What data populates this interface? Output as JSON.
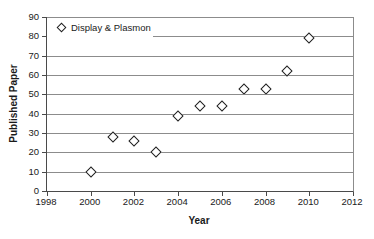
{
  "chart_data": {
    "type": "scatter",
    "title": "",
    "xlabel": "Year",
    "ylabel": "Published Paper",
    "legend": {
      "label": "Display & Plasmon",
      "marker": "open-diamond",
      "position": "top-left-inside"
    },
    "series": [
      {
        "name": "Display & Plasmon",
        "x": [
          2000,
          2001,
          2002,
          2003,
          2004,
          2005,
          2006,
          2007,
          2008,
          2009,
          2010
        ],
        "y": [
          10,
          28,
          26,
          20,
          39,
          44,
          44,
          53,
          53,
          62,
          79
        ]
      }
    ],
    "xlim": [
      1998,
      2012
    ],
    "ylim": [
      0,
      90
    ],
    "xticks": [
      1998,
      2000,
      2002,
      2004,
      2006,
      2008,
      2010,
      2012
    ],
    "yticks": [
      0,
      10,
      20,
      30,
      40,
      50,
      60,
      70,
      80,
      90
    ],
    "grid": "horizontal",
    "colors": {
      "marker_outline": "#1f1f1f",
      "marker_fill": "#ffffff",
      "gridline": "#8c8c8c",
      "axis": "#4a4a4a",
      "text": "#1a1a1a",
      "background": "#ffffff"
    }
  }
}
